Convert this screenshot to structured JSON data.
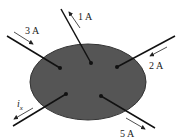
{
  "diagram": {
    "type": "circuit-node-currents",
    "region_color": "#555555",
    "wire_color": "#111111",
    "wires": [
      {
        "id": "top",
        "label": "1 A",
        "direction": "out"
      },
      {
        "id": "upper-left",
        "label": "3 A",
        "direction": "in"
      },
      {
        "id": "upper-right",
        "label": "2 A",
        "direction": "in"
      },
      {
        "id": "lower-left",
        "label": "i",
        "subscript": "x",
        "direction": "out"
      },
      {
        "id": "lower-right",
        "label": "5 A",
        "direction": "out"
      }
    ]
  }
}
